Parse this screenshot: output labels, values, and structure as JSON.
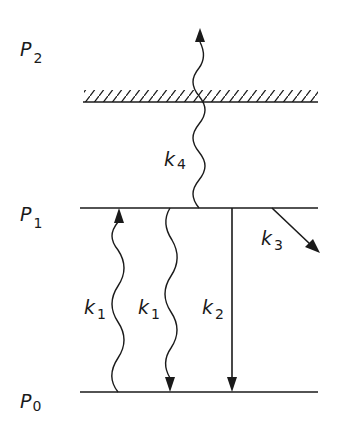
{
  "diagram": {
    "type": "energy-level-diagram",
    "levels": [
      {
        "id": "P2",
        "label": "P",
        "subscript": "2",
        "style": "hatched-continuum"
      },
      {
        "id": "P1",
        "label": "P",
        "subscript": "1",
        "style": "line"
      },
      {
        "id": "P0",
        "label": "P",
        "subscript": "0",
        "style": "line"
      }
    ],
    "transitions": [
      {
        "id": "k4",
        "label": "k",
        "subscript": "4",
        "from": "P1",
        "to": "P2",
        "style": "wavy",
        "direction": "up"
      },
      {
        "id": "k1_up",
        "label": "k",
        "subscript": "1",
        "from": "P0",
        "to": "P1",
        "style": "wavy",
        "direction": "up"
      },
      {
        "id": "k1_down",
        "label": "k",
        "subscript": "1",
        "from": "P1",
        "to": "P0",
        "style": "wavy",
        "direction": "down"
      },
      {
        "id": "k2",
        "label": "k",
        "subscript": "2",
        "from": "P1",
        "to": "P0",
        "style": "straight",
        "direction": "down"
      },
      {
        "id": "k3",
        "label": "k",
        "subscript": "3",
        "from": "P1",
        "to": "out",
        "style": "straight-diagonal",
        "direction": "down-right"
      }
    ]
  },
  "colors": {
    "ink": "#1a1a1a",
    "background": "#ffffff"
  }
}
